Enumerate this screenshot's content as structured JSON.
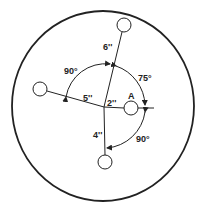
{
  "figure": {
    "type": "balancing-disc-diagram",
    "colors": {
      "ink": "#222222",
      "background": "#ffffff"
    },
    "outer_disc": {
      "cx": 103,
      "cy": 106,
      "rx": 91,
      "ry": 95
    },
    "hub": {
      "x": 104,
      "y": 107
    },
    "weights": [
      {
        "id": "top",
        "x": 124,
        "y": 25,
        "r": 7,
        "distance_label": "6''"
      },
      {
        "id": "left",
        "x": 40,
        "y": 89,
        "r": 7,
        "distance_label": "5''"
      },
      {
        "id": "bottom",
        "x": 105,
        "y": 162,
        "r": 7,
        "distance_label": "4''"
      },
      {
        "id": "A",
        "x": 131,
        "y": 108,
        "r": 7,
        "distance_label": "2''",
        "name_label": "A"
      }
    ],
    "angles": [
      {
        "between": "left-top",
        "label": "90°"
      },
      {
        "between": "top-A",
        "label": "75°"
      },
      {
        "between": "A-bottom",
        "label": "90°"
      }
    ],
    "labels": {
      "top_distance": "6''",
      "left_distance": "5''",
      "a_distance": "2''",
      "bottom_distance": "4''",
      "a_name": "A",
      "angle_left_top": "90°",
      "angle_top_a": "75°",
      "angle_a_bottom": "90°"
    }
  }
}
